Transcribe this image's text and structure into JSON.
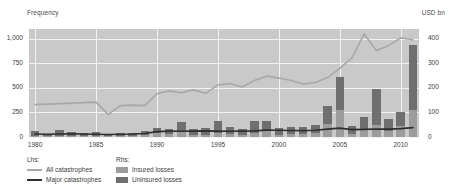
{
  "axes": {
    "left_title": "Frequency",
    "right_title": "USD bn"
  },
  "legend": {
    "lhs_head": "Lhs:",
    "rhs_head": "Rhs:",
    "all_catastrophes": "All catastrophes",
    "major_catastrophes": "Major catastrophes",
    "insured_losses": "Insured losses",
    "uninsured_losses": "Uninsured losses"
  },
  "colors": {
    "plot_background": "#c9c9c9",
    "gridline": "#f2f2f2",
    "insured_bar": "#9c9c9c",
    "uninsured_bar": "#6f6f6f",
    "all_catastrophes_line": "#a8a8a8",
    "major_catastrophes_line": "#2f2f2f",
    "text": "#3d3d3d"
  },
  "chart_data": {
    "type": "bar",
    "title": "",
    "subtitle": "",
    "xlabel": "",
    "ylabel": "Frequency",
    "y2label": "USD bn",
    "grid": true,
    "legend_position": "bottom-left",
    "x": [
      1980,
      1981,
      1982,
      1983,
      1984,
      1985,
      1986,
      1987,
      1988,
      1989,
      1990,
      1991,
      1992,
      1993,
      1994,
      1995,
      1996,
      1997,
      1998,
      1999,
      2000,
      2001,
      2002,
      2003,
      2004,
      2005,
      2006,
      2007,
      2008,
      2009,
      2010,
      2011
    ],
    "xticks": [
      1980,
      1985,
      1990,
      1995,
      2000,
      2005,
      2010
    ],
    "ylim": [
      0,
      1100
    ],
    "yticks": [
      0,
      250,
      500,
      750,
      1000
    ],
    "yticklabels": [
      "0",
      "250",
      "500",
      "750",
      "1,000"
    ],
    "y2lim": [
      0,
      440
    ],
    "y2ticks": [
      0,
      100,
      200,
      300,
      400
    ],
    "y2ticklabels": [
      "0",
      "100",
      "200",
      "300",
      "400"
    ],
    "series": [
      {
        "name": "Insured losses",
        "type": "bar",
        "axis": "right",
        "stack": "losses",
        "unit": "USD bn",
        "values": [
          5,
          4,
          3,
          6,
          4,
          5,
          3,
          6,
          5,
          9,
          15,
          12,
          25,
          10,
          7,
          16,
          13,
          9,
          18,
          26,
          10,
          13,
          12,
          17,
          52,
          110,
          14,
          30,
          50,
          25,
          43,
          110
        ]
      },
      {
        "name": "Uninsured losses",
        "type": "bar",
        "axis": "right",
        "stack": "losses",
        "unit": "USD bn",
        "values": [
          20,
          7,
          24,
          15,
          11,
          15,
          7,
          9,
          11,
          17,
          22,
          20,
          36,
          24,
          31,
          50,
          29,
          22,
          49,
          39,
          26,
          29,
          27,
          33,
          75,
          135,
          30,
          53,
          145,
          50,
          57,
          265
        ]
      },
      {
        "name": "All catastrophes",
        "type": "line",
        "axis": "left",
        "unit": "count",
        "values": [
          330,
          335,
          340,
          345,
          350,
          355,
          230,
          320,
          325,
          320,
          440,
          470,
          450,
          480,
          445,
          530,
          545,
          510,
          575,
          620,
          600,
          575,
          540,
          555,
          605,
          700,
          805,
          1050,
          880,
          930,
          1010,
          990
        ]
      },
      {
        "name": "Major catastrophes",
        "type": "line",
        "axis": "left",
        "unit": "count",
        "values": [
          30,
          28,
          30,
          32,
          30,
          28,
          26,
          28,
          30,
          35,
          55,
          60,
          58,
          60,
          62,
          60,
          58,
          60,
          62,
          70,
          68,
          66,
          65,
          68,
          80,
          90,
          75,
          78,
          82,
          80,
          85,
          95
        ]
      }
    ]
  }
}
